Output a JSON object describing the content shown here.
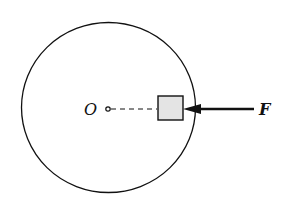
{
  "diagram": {
    "center_label": "O",
    "force_label": "F",
    "colors": {
      "stroke": "#111111",
      "block_fill": "#e4e4e4",
      "background": "#ffffff"
    }
  }
}
